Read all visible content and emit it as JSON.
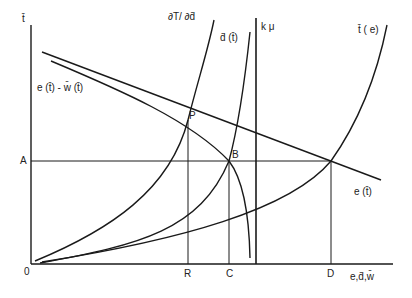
{
  "diagram": {
    "axes": {
      "y_label": "t̄",
      "x_label": "e,d̄,w̄",
      "origin_label": "0"
    },
    "y_ticks": [
      {
        "label": "A"
      }
    ],
    "x_ticks": [
      {
        "label": "R"
      },
      {
        "label": "C"
      },
      {
        "label": "D"
      }
    ],
    "points": [
      {
        "label": "P"
      },
      {
        "label": "B"
      }
    ],
    "curves": [
      {
        "id": "dT_dd",
        "label": "∂T/ ∂d̄"
      },
      {
        "id": "d_t",
        "label": "d̄ (t̄)"
      },
      {
        "id": "k_mu",
        "label": "k μ"
      },
      {
        "id": "t_e",
        "label": "t̄ ( e)"
      },
      {
        "id": "e_minus_w",
        "label": "e (t̄) - w̄ (t̄)"
      },
      {
        "id": "e_t",
        "label": "e (t̄)"
      }
    ],
    "colors": {
      "line": "#1a1a1a",
      "background": "#ffffff"
    }
  }
}
